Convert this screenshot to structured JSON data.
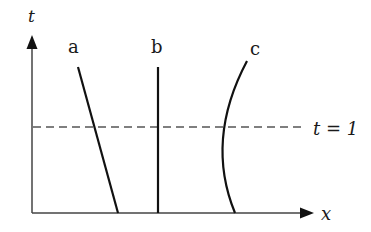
{
  "diagram": {
    "type": "spacetime-worldlines",
    "axes": {
      "vertical": {
        "label": "t"
      },
      "horizontal": {
        "label": "x"
      }
    },
    "reference_line": {
      "label": "t = 1",
      "style": "dashed"
    },
    "worldlines": [
      {
        "id": "a",
        "label": "a",
        "shape": "straight, slanting right toward bottom"
      },
      {
        "id": "b",
        "label": "b",
        "shape": "straight vertical"
      },
      {
        "id": "c",
        "label": "c",
        "shape": "curved, bowing left"
      }
    ],
    "colors": {
      "ink": "#1a1a1a",
      "dash": "#555555",
      "background": "#ffffff"
    }
  }
}
